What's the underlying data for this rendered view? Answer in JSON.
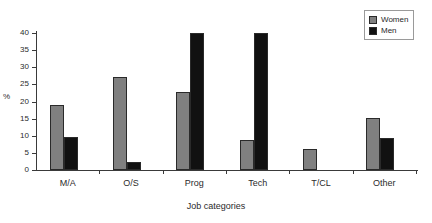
{
  "chart_data": {
    "type": "bar",
    "title": "",
    "xlabel": "Job categories",
    "ylabel": "%",
    "ylim": [
      0,
      40
    ],
    "yticks": [
      0,
      5,
      10,
      15,
      20,
      25,
      30,
      35,
      40
    ],
    "ytick_labels": [
      "0",
      "5",
      "10",
      "15",
      "20",
      "25",
      "30",
      "35",
      "40"
    ],
    "grid": false,
    "legend_position": "top-right",
    "categories": [
      "M/A",
      "O/S",
      "Prog",
      "Tech",
      "T/CL",
      "Other"
    ],
    "series": [
      {
        "name": "Women",
        "color": "#808080",
        "values": [
          19,
          27.3,
          22.7,
          8.7,
          6.2,
          15.3
        ]
      },
      {
        "name": "Men",
        "color": "#111111",
        "values": [
          9.5,
          2.3,
          40,
          40,
          0,
          9.4
        ]
      }
    ]
  },
  "legend": {
    "entries": [
      {
        "label": "Women"
      },
      {
        "label": "Men"
      }
    ]
  }
}
